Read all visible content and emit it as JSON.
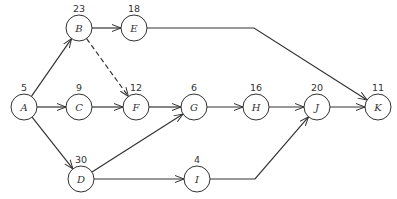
{
  "diagram": {
    "type": "activity-network",
    "nodes": [
      {
        "id": "A",
        "label": "A",
        "duration": "5",
        "x": 24,
        "y": 107
      },
      {
        "id": "B",
        "label": "B",
        "duration": "23",
        "x": 79,
        "y": 28
      },
      {
        "id": "C",
        "label": "C",
        "duration": "9",
        "x": 79,
        "y": 107
      },
      {
        "id": "D",
        "label": "D",
        "duration": "30",
        "x": 81,
        "y": 179
      },
      {
        "id": "E",
        "label": "E",
        "duration": "18",
        "x": 134,
        "y": 28
      },
      {
        "id": "F",
        "label": "F",
        "duration": "12",
        "x": 136,
        "y": 107
      },
      {
        "id": "G",
        "label": "G",
        "duration": "6",
        "x": 194,
        "y": 107
      },
      {
        "id": "H",
        "label": "H",
        "duration": "16",
        "x": 256,
        "y": 107
      },
      {
        "id": "I",
        "label": "I",
        "duration": "4",
        "x": 197,
        "y": 179
      },
      {
        "id": "J",
        "label": "J",
        "duration": "20",
        "x": 317,
        "y": 107
      },
      {
        "id": "K",
        "label": "K",
        "duration": "11",
        "x": 378,
        "y": 107
      }
    ],
    "edges": [
      {
        "from": "A",
        "to": "B",
        "style": "solid"
      },
      {
        "from": "A",
        "to": "C",
        "style": "solid"
      },
      {
        "from": "A",
        "to": "D",
        "style": "solid"
      },
      {
        "from": "B",
        "to": "E",
        "style": "solid"
      },
      {
        "from": "B",
        "to": "F",
        "style": "dashed"
      },
      {
        "from": "C",
        "to": "F",
        "style": "solid"
      },
      {
        "from": "F",
        "to": "G",
        "style": "solid"
      },
      {
        "from": "D",
        "to": "G",
        "style": "solid"
      },
      {
        "from": "G",
        "to": "H",
        "style": "solid"
      },
      {
        "from": "H",
        "to": "J",
        "style": "solid"
      },
      {
        "from": "J",
        "to": "K",
        "style": "solid"
      },
      {
        "from": "D",
        "to": "I",
        "style": "solid"
      },
      {
        "from": "I",
        "to": "J",
        "style": "solid",
        "via": [
          [
            255,
            179
          ]
        ]
      },
      {
        "from": "E",
        "to": "K",
        "style": "solid",
        "via": [
          [
            254,
            28
          ]
        ]
      }
    ],
    "colors": {
      "stroke": "#333333",
      "fill": "#ffffff"
    }
  }
}
